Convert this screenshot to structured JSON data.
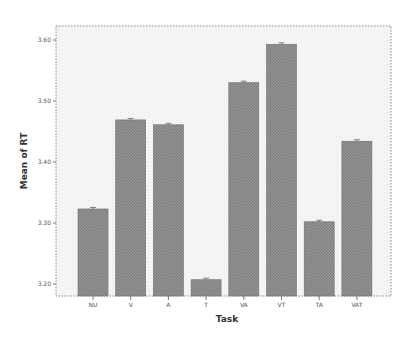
{
  "chart_data": {
    "type": "bar",
    "title": "",
    "xlabel": "Task",
    "ylabel": "Mean of RT",
    "categories": [
      "NU",
      "V",
      "A",
      "T",
      "VA",
      "VT",
      "TA",
      "VAT"
    ],
    "values": [
      3.323,
      3.469,
      3.461,
      3.207,
      3.53,
      3.593,
      3.302,
      3.434
    ],
    "ylim": [
      3.18,
      3.62
    ],
    "yticks": [
      3.2,
      3.3,
      3.4,
      3.5,
      3.6
    ],
    "ytick_labels": [
      "3.20",
      "3.30",
      "3.40",
      "3.50",
      "3.60"
    ],
    "grid": false,
    "legend": null,
    "error_bars": true,
    "colors": {
      "bar_fill": "#8c8c8c",
      "bar_pattern_light": "#b4b4b4",
      "plot_bg": "#f3f3f3",
      "frame": "#888888"
    }
  }
}
